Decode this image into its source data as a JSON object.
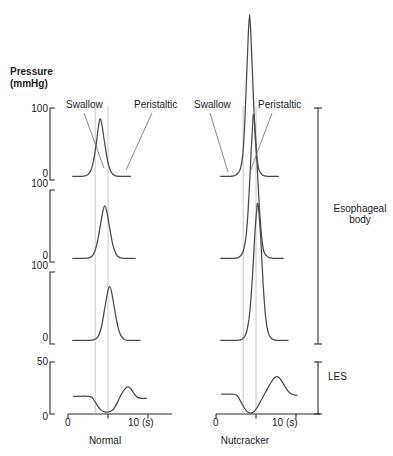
{
  "figure": {
    "y_axis_title_line1": "Pressure",
    "y_axis_title_line2": "(mmHg)",
    "columns": [
      {
        "name": "normal",
        "label": "Normal"
      },
      {
        "name": "nutcracker",
        "label": "Nutcracker"
      }
    ],
    "annotations": {
      "swallow": "Swallow",
      "peristaltic": "Peristaltic"
    },
    "region_brackets": [
      {
        "name": "esophageal-body",
        "label_line1": "Esophageal",
        "label_line2": "body"
      },
      {
        "name": "les",
        "label_line1": "LES",
        "label_line2": ""
      }
    ],
    "x_axis": {
      "tick_labels": [
        "0",
        "10 (s)"
      ],
      "unit": "(s)",
      "min": 0,
      "max": 11.5
    }
  },
  "chart_data": {
    "type": "line",
    "xlabel": "(s)",
    "ylabel": "Pressure (mmHg)",
    "xlim": [
      0,
      11.5
    ],
    "grid": false,
    "legend_position": "none",
    "panel_rows": [
      {
        "name": "esophageal-body-upper",
        "ylim": [
          0,
          100
        ],
        "y_ticks": [
          0,
          100
        ],
        "y_tick_labels": [
          "0",
          "100"
        ]
      },
      {
        "name": "esophageal-body-middle",
        "ylim": [
          0,
          100
        ],
        "y_ticks": [
          0,
          100
        ],
        "y_tick_labels": [
          "0",
          "100"
        ]
      },
      {
        "name": "esophageal-body-lower",
        "ylim": [
          0,
          100
        ],
        "y_ticks": [
          0,
          100
        ],
        "y_tick_labels": [
          "0",
          "100"
        ]
      },
      {
        "name": "les",
        "ylim": [
          0,
          50
        ],
        "y_ticks": [
          0,
          50
        ],
        "y_tick_labels": [
          "0",
          "50"
        ]
      }
    ],
    "timing_markers": {
      "swallow_time": 3.4,
      "peristaltic_time": 5.0
    },
    "series": [
      {
        "name": "normal-upper-esophageal-body",
        "column": "normal",
        "panel": "esophageal-body-upper",
        "peak_time": 4.0,
        "peak_pressure": 85,
        "baseline": 5,
        "width": 1.05,
        "points": [
          [
            0.6,
            5
          ],
          [
            1.6,
            5
          ],
          [
            2.2,
            6
          ],
          [
            2.7,
            10
          ],
          [
            3.1,
            22
          ],
          [
            3.5,
            48
          ],
          [
            3.8,
            74
          ],
          [
            4.0,
            85
          ],
          [
            4.25,
            76
          ],
          [
            4.6,
            50
          ],
          [
            5.0,
            24
          ],
          [
            5.4,
            11
          ],
          [
            5.9,
            6
          ],
          [
            6.6,
            5
          ],
          [
            7.8,
            5
          ]
        ]
      },
      {
        "name": "normal-middle-esophageal-body",
        "column": "normal",
        "panel": "esophageal-body-middle",
        "peak_time": 4.6,
        "peak_pressure": 78,
        "baseline": 5,
        "width": 1.05,
        "points": [
          [
            0.6,
            5
          ],
          [
            1.9,
            5
          ],
          [
            2.7,
            6
          ],
          [
            3.2,
            11
          ],
          [
            3.6,
            24
          ],
          [
            4.0,
            48
          ],
          [
            4.35,
            70
          ],
          [
            4.6,
            78
          ],
          [
            4.85,
            70
          ],
          [
            5.2,
            48
          ],
          [
            5.6,
            24
          ],
          [
            6.0,
            11
          ],
          [
            6.5,
            6
          ],
          [
            7.2,
            5
          ],
          [
            8.4,
            5
          ]
        ]
      },
      {
        "name": "normal-lower-esophageal-body",
        "column": "normal",
        "panel": "esophageal-body-lower",
        "peak_time": 5.2,
        "peak_pressure": 80,
        "baseline": 5,
        "width": 1.0,
        "points": [
          [
            0.6,
            5
          ],
          [
            2.4,
            5
          ],
          [
            3.3,
            6
          ],
          [
            3.8,
            11
          ],
          [
            4.2,
            25
          ],
          [
            4.6,
            50
          ],
          [
            4.95,
            72
          ],
          [
            5.2,
            80
          ],
          [
            5.45,
            72
          ],
          [
            5.8,
            50
          ],
          [
            6.2,
            26
          ],
          [
            6.6,
            12
          ],
          [
            7.1,
            6
          ],
          [
            7.8,
            5
          ],
          [
            9.0,
            5
          ]
        ]
      },
      {
        "name": "normal-les",
        "column": "normal",
        "panel": "les",
        "resting_pressure": 18,
        "nadir_pressure": 2,
        "after_contraction_peak": 26,
        "points": [
          [
            0.7,
            17
          ],
          [
            2.6,
            17
          ],
          [
            3.1,
            15
          ],
          [
            3.6,
            9
          ],
          [
            4.1,
            4
          ],
          [
            4.6,
            2
          ],
          [
            5.1,
            2
          ],
          [
            5.6,
            4
          ],
          [
            6.1,
            10
          ],
          [
            6.6,
            18
          ],
          [
            7.1,
            24
          ],
          [
            7.5,
            26
          ],
          [
            7.9,
            24
          ],
          [
            8.3,
            19
          ],
          [
            8.7,
            16
          ],
          [
            9.2,
            15
          ],
          [
            9.8,
            15
          ]
        ]
      },
      {
        "name": "nutcracker-upper-esophageal-body",
        "column": "nutcracker",
        "panel": "esophageal-body-upper",
        "peak_time": 4.2,
        "peak_pressure": 230,
        "baseline": 5,
        "width": 0.55,
        "overshoot": true,
        "points": [
          [
            0.6,
            5
          ],
          [
            1.8,
            5
          ],
          [
            2.5,
            7
          ],
          [
            3.0,
            14
          ],
          [
            3.35,
            36
          ],
          [
            3.6,
            80
          ],
          [
            3.85,
            150
          ],
          [
            4.05,
            205
          ],
          [
            4.2,
            230
          ],
          [
            4.35,
            205
          ],
          [
            4.55,
            150
          ],
          [
            4.8,
            82
          ],
          [
            5.05,
            38
          ],
          [
            5.35,
            15
          ],
          [
            5.8,
            7
          ],
          [
            6.6,
            5
          ],
          [
            7.8,
            5
          ]
        ]
      },
      {
        "name": "nutcracker-middle-esophageal-body",
        "column": "nutcracker",
        "panel": "esophageal-body-middle",
        "peak_time": 4.7,
        "peak_pressure": 205,
        "baseline": 5,
        "width": 0.55,
        "overshoot": true,
        "points": [
          [
            0.6,
            5
          ],
          [
            2.2,
            5
          ],
          [
            2.9,
            7
          ],
          [
            3.4,
            15
          ],
          [
            3.8,
            40
          ],
          [
            4.1,
            88
          ],
          [
            4.4,
            155
          ],
          [
            4.6,
            195
          ],
          [
            4.7,
            205
          ],
          [
            4.85,
            190
          ],
          [
            5.1,
            145
          ],
          [
            5.4,
            80
          ],
          [
            5.7,
            36
          ],
          [
            6.0,
            14
          ],
          [
            6.5,
            7
          ],
          [
            7.2,
            5
          ],
          [
            8.4,
            5
          ]
        ]
      },
      {
        "name": "nutcracker-lower-esophageal-body",
        "column": "nutcracker",
        "panel": "esophageal-body-lower",
        "peak_time": 5.2,
        "peak_pressure": 195,
        "baseline": 5,
        "width": 0.6,
        "overshoot": true,
        "points": [
          [
            0.6,
            5
          ],
          [
            2.6,
            5
          ],
          [
            3.3,
            7
          ],
          [
            3.8,
            16
          ],
          [
            4.2,
            42
          ],
          [
            4.55,
            92
          ],
          [
            4.85,
            152
          ],
          [
            5.1,
            188
          ],
          [
            5.2,
            195
          ],
          [
            5.35,
            185
          ],
          [
            5.6,
            145
          ],
          [
            5.9,
            82
          ],
          [
            6.2,
            38
          ],
          [
            6.55,
            15
          ],
          [
            7.0,
            7
          ],
          [
            7.8,
            5
          ],
          [
            9.0,
            5
          ]
        ]
      },
      {
        "name": "nutcracker-les",
        "column": "nutcracker",
        "panel": "les",
        "resting_pressure": 20,
        "nadir_pressure": 1,
        "after_contraction_peak": 36,
        "points": [
          [
            0.7,
            19
          ],
          [
            2.3,
            19
          ],
          [
            2.8,
            16
          ],
          [
            3.3,
            9
          ],
          [
            3.8,
            3
          ],
          [
            4.2,
            1
          ],
          [
            4.7,
            2
          ],
          [
            5.2,
            7
          ],
          [
            5.7,
            14
          ],
          [
            6.2,
            21
          ],
          [
            6.7,
            28
          ],
          [
            7.2,
            34
          ],
          [
            7.6,
            36
          ],
          [
            8.0,
            34
          ],
          [
            8.5,
            28
          ],
          [
            9.0,
            22
          ],
          [
            9.5,
            19
          ],
          [
            10.1,
            18
          ]
        ]
      }
    ]
  }
}
